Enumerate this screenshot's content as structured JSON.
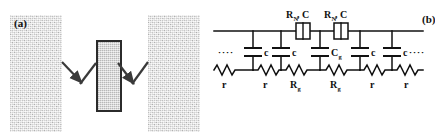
{
  "figure": {
    "panels": [
      {
        "id": "a",
        "label": "(a)",
        "caption_label": "(a)",
        "description": "Schematic of two grains separated by a grain boundary layer",
        "elements": {
          "grain_left": "grain-region-left",
          "grain_right": "grain-region-right",
          "boundary": "grain-boundary-slab",
          "arrows": "conduction-path-arrows"
        }
      },
      {
        "id": "b",
        "label": "(b)",
        "caption_label": "(b)",
        "description": "Equivalent circuit ladder network",
        "circuit": {
          "top_labels": [
            {
              "text": "R",
              "sub": "N",
              "tail": ", C"
            },
            {
              "text": "R",
              "sub": "N",
              "tail": ", C"
            }
          ],
          "top_label_strings": [
            "R_N, C",
            "R_N, C"
          ],
          "series_elements": [
            {
              "name": "resistor-box-1",
              "label": "R_N, C"
            },
            {
              "name": "resistor-box-2",
              "label": "R_N, C"
            }
          ],
          "shunt_capacitors": [
            {
              "label": "c",
              "sub": ""
            },
            {
              "label": "c",
              "sub": ""
            },
            {
              "label": "C",
              "sub": "g"
            },
            {
              "label": "c",
              "sub": ""
            },
            {
              "label": "c",
              "sub": ""
            }
          ],
          "shunt_capacitor_strings": [
            "c",
            "c",
            "C_g",
            "c",
            "c"
          ],
          "bottom_resistors": [
            {
              "label": "r",
              "sub": ""
            },
            {
              "label": "r",
              "sub": ""
            },
            {
              "label": "R",
              "sub": "g"
            },
            {
              "label": "R",
              "sub": "g"
            },
            {
              "label": "r",
              "sub": ""
            },
            {
              "label": "r",
              "sub": ""
            }
          ],
          "bottom_resistor_strings": [
            "r",
            "r",
            "R_g",
            "R_g",
            "r",
            "r"
          ],
          "continuation_left": "····",
          "continuation_right": "····"
        }
      }
    ],
    "colors": {
      "ink": "#111111",
      "grain_fill": "#d6d6d6",
      "boundary_fill": "#cfcfcf",
      "boundary_stroke": "#2b2b2b",
      "background": "#ffffff"
    }
  }
}
